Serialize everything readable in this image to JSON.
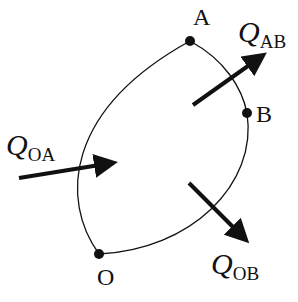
{
  "diagram": {
    "type": "thermodynamic-cycle-path",
    "colors": {
      "stroke": "#111111",
      "background": "#ffffff"
    },
    "points": [
      {
        "id": "A",
        "label": "A"
      },
      {
        "id": "B",
        "label": "B"
      },
      {
        "id": "O",
        "label": "O"
      }
    ],
    "paths": [
      {
        "from": "O",
        "to": "A",
        "shape": "arc"
      },
      {
        "from": "A",
        "to": "B",
        "shape": "arc"
      },
      {
        "from": "B",
        "to": "O",
        "shape": "arc"
      }
    ],
    "heat_flows": [
      {
        "id": "QOA",
        "symbol": "Q",
        "subscript": "OA",
        "direction": "inward"
      },
      {
        "id": "QAB",
        "symbol": "Q",
        "subscript": "AB",
        "direction": "outward"
      },
      {
        "id": "QOB",
        "symbol": "Q",
        "subscript": "OB",
        "direction": "outward"
      }
    ]
  }
}
